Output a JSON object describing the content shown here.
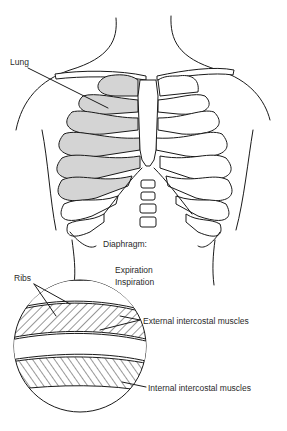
{
  "figure": {
    "type": "anatomical-diagram",
    "labels": {
      "lung": "Lung",
      "diaphragm": "Diaphragm:",
      "expiration": "Expiration",
      "inspiration": "Inspiration",
      "ribs": "Ribs",
      "external_intercostal": "External intercostal muscles",
      "internal_intercostal": "Internal intercostal muscles"
    },
    "colors": {
      "line": "#1a1a1a",
      "lung_fill": "#d4d4d4",
      "background": "#ffffff"
    }
  }
}
